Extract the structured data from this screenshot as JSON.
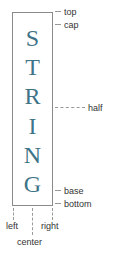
{
  "diagram": {
    "word": "STRING",
    "letters": [
      "S",
      "T",
      "R",
      "I",
      "N",
      "G"
    ],
    "letter_color": "#3f7387",
    "border_color": "#8a8a8a",
    "vertical_labels": {
      "top": "top",
      "cap": "cap",
      "half": "half",
      "base": "base",
      "bottom": "bottom"
    },
    "horizontal_labels": {
      "left": "left",
      "center": "center",
      "right": "right"
    }
  }
}
